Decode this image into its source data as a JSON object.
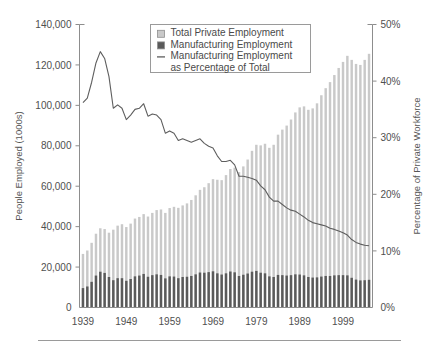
{
  "figure": {
    "background": "#ffffff",
    "rule_color": "#9a9a9a"
  },
  "legend": {
    "position": "top-center",
    "items": [
      {
        "label": "Total Private Employment",
        "marker": "swatch-light",
        "color": "#c9c9c9"
      },
      {
        "label": "Manufacturing Employment",
        "marker": "swatch-dark",
        "color": "#5a5a5a"
      },
      {
        "label": "Manufacturing Employment",
        "marker": "line",
        "color": "#5e5e5e"
      },
      {
        "label": "as Percentage of Total",
        "marker": "none",
        "color": "#5e5e5e"
      }
    ]
  },
  "chart_data": {
    "type": "bar",
    "title": "",
    "xlabel": "",
    "ylabel": "People Employed (1000s)",
    "y2label": "Percentage of Private Workforce",
    "grid": false,
    "legend_position": "top-center",
    "xlim": [
      1938.2,
      2005.8
    ],
    "ylim": [
      0,
      140000
    ],
    "y2lim": [
      0,
      50
    ],
    "yticks": [
      0,
      20000,
      40000,
      60000,
      80000,
      100000,
      120000,
      140000
    ],
    "ytick_labels": [
      "0",
      "20,000",
      "40,000",
      "60,000",
      "80,000",
      "100,000",
      "120,000",
      "140,000"
    ],
    "y2ticks": [
      0,
      10,
      20,
      30,
      40,
      50
    ],
    "y2tick_labels": [
      "0%",
      "10%",
      "20%",
      "30%",
      "40%",
      "50%"
    ],
    "xticks": [
      1939,
      1949,
      1959,
      1969,
      1979,
      1989,
      1999
    ],
    "xtick_labels": [
      "1939",
      "1949",
      "1959",
      "1969",
      "1979",
      "1989",
      "1999"
    ],
    "categories": [
      1939,
      1940,
      1941,
      1942,
      1943,
      1944,
      1945,
      1946,
      1947,
      1948,
      1949,
      1950,
      1951,
      1952,
      1953,
      1954,
      1955,
      1956,
      1957,
      1958,
      1959,
      1960,
      1961,
      1962,
      1963,
      1964,
      1965,
      1966,
      1967,
      1968,
      1969,
      1970,
      1971,
      1972,
      1973,
      1974,
      1975,
      1976,
      1977,
      1978,
      1979,
      1980,
      1981,
      1982,
      1983,
      1984,
      1985,
      1986,
      1987,
      1988,
      1989,
      1990,
      1991,
      1992,
      1993,
      1994,
      1995,
      1996,
      1997,
      1998,
      1999,
      2000,
      2001,
      2002,
      2003,
      2004,
      2005
    ],
    "series": [
      {
        "name": "Total Private Employment",
        "axis": "left",
        "color": "#c9c9c9",
        "values": [
          26500,
          28200,
          32000,
          36500,
          39200,
          38800,
          37000,
          38500,
          40500,
          41200,
          39800,
          41500,
          44000,
          44800,
          46200,
          45000,
          46800,
          48200,
          48500,
          46800,
          49200,
          49800,
          49300,
          50500,
          51500,
          53200,
          55500,
          58200,
          59500,
          61500,
          63500,
          63200,
          63000,
          65500,
          68500,
          69200,
          67000,
          69800,
          73200,
          77500,
          80500,
          80200,
          81000,
          79000,
          80500,
          85500,
          88000,
          90000,
          93000,
          96500,
          99000,
          99500,
          97800,
          98500,
          101000,
          105000,
          108500,
          111500,
          115000,
          118500,
          121500,
          124500,
          122500,
          120500,
          120000,
          122500,
          125500
        ],
        "percent_of_total": [
          36.2,
          37.0,
          39.8,
          43.2,
          45.2,
          44.0,
          40.8,
          35.2,
          35.8,
          35.2,
          33.2,
          34.0,
          35.0,
          35.2,
          36.0,
          33.8,
          34.2,
          34.0,
          33.2,
          30.8,
          31.2,
          30.8,
          29.5,
          29.8,
          29.5,
          29.2,
          29.5,
          29.8,
          29.0,
          28.5,
          28.2,
          26.8,
          25.8,
          25.8,
          26.0,
          25.2,
          23.2,
          23.2,
          23.0,
          22.8,
          22.5,
          21.5,
          20.8,
          19.5,
          18.8,
          18.8,
          18.2,
          17.6,
          17.2,
          17.0,
          16.5,
          16.0,
          15.4,
          15.0,
          14.8,
          14.6,
          14.4,
          14.0,
          13.8,
          13.5,
          13.2,
          12.8,
          12.0,
          11.5,
          11.2,
          11.0,
          10.9
        ]
      },
      {
        "name": "Manufacturing Employment",
        "axis": "left",
        "color": "#5a5a5a",
        "values": [
          9600,
          10400,
          12700,
          15800,
          17700,
          17100,
          15100,
          13500,
          14500,
          14500,
          13200,
          14100,
          15400,
          15800,
          16600,
          15200,
          16000,
          16400,
          16100,
          14400,
          15400,
          15300,
          14500,
          15100,
          15200,
          15600,
          16400,
          17300,
          17200,
          17500,
          17900,
          16900,
          16300,
          16900,
          17800,
          17400,
          15600,
          16200,
          16800,
          17700,
          18100,
          17200,
          16900,
          15400,
          15100,
          16100,
          16000,
          15800,
          16000,
          16400,
          16300,
          15900,
          15100,
          14800,
          14900,
          15300,
          15600,
          15600,
          15900,
          16000,
          16000,
          15900,
          14700,
          13800,
          13400,
          13500,
          13700
        ]
      }
    ]
  }
}
